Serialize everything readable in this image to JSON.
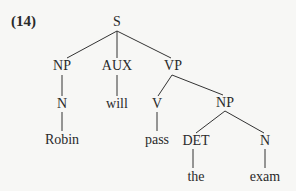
{
  "example_number": "(14)",
  "tree": {
    "nodes": {
      "S": {
        "label": "S",
        "x": 117,
        "y": 22
      },
      "NP1": {
        "label": "NP",
        "x": 62,
        "y": 66
      },
      "AUX": {
        "label": "AUX",
        "x": 117,
        "y": 66
      },
      "VP": {
        "label": "VP",
        "x": 173,
        "y": 66
      },
      "N1": {
        "label": "N",
        "x": 62,
        "y": 104
      },
      "will": {
        "label": "will",
        "x": 117,
        "y": 104
      },
      "V": {
        "label": "V",
        "x": 157,
        "y": 104
      },
      "NP2": {
        "label": "NP",
        "x": 225,
        "y": 103
      },
      "Robin": {
        "label": "Robin",
        "x": 62,
        "y": 140
      },
      "pass": {
        "label": "pass",
        "x": 157,
        "y": 140
      },
      "DET": {
        "label": "DET",
        "x": 198,
        "y": 141
      },
      "N2": {
        "label": "N",
        "x": 265,
        "y": 141
      },
      "the": {
        "label": "the",
        "x": 198,
        "y": 177
      },
      "exam": {
        "label": "exam",
        "x": 265,
        "y": 177
      }
    },
    "edges": [
      [
        "S",
        "NP1"
      ],
      [
        "S",
        "AUX"
      ],
      [
        "S",
        "VP"
      ],
      [
        "NP1",
        "N1"
      ],
      [
        "AUX",
        "will"
      ],
      [
        "VP",
        "V"
      ],
      [
        "VP",
        "NP2"
      ],
      [
        "N1",
        "Robin"
      ],
      [
        "V",
        "pass"
      ],
      [
        "NP2",
        "DET"
      ],
      [
        "NP2",
        "N2"
      ],
      [
        "DET",
        "the"
      ],
      [
        "N2",
        "exam"
      ]
    ]
  }
}
